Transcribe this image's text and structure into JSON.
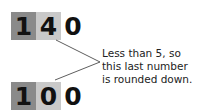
{
  "top_number": {
    "digits": [
      "1",
      "4",
      "0"
    ]
  },
  "bottom_number": {
    "digits": [
      "1",
      "0",
      "0"
    ]
  },
  "annotation": {
    "lines": [
      "Less than 5, so",
      "this last number",
      "is rounded down."
    ]
  },
  "colors": {
    "dark_cell": "#8a8a8a",
    "light_cell": "#c9c9c9",
    "line": "#333333"
  }
}
